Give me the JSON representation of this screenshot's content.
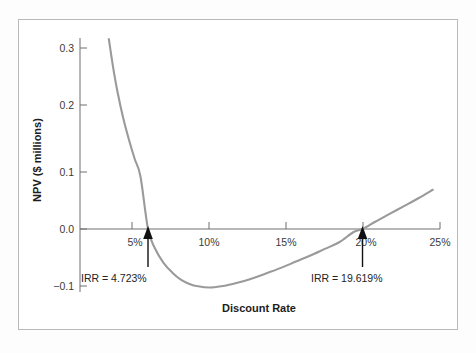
{
  "figure": {
    "curve_color": "#9a9a9a",
    "axis_color": "#6f6f6f",
    "frame_color": "#b9b9b9",
    "annotation_color": "#111111"
  },
  "chart_data": {
    "type": "line",
    "title": "",
    "subtitle": "",
    "xlabel": "Discount Rate",
    "ylabel": "NPV ($ millions)",
    "xlim": [
      0,
      26
    ],
    "ylim": [
      -0.13,
      0.33
    ],
    "grid": false,
    "legend": null,
    "x_unit": "%",
    "y_unit": "$ millions",
    "x_ticks": [
      5,
      10,
      15,
      20,
      25
    ],
    "x_tick_labels": [
      "5%",
      "10%",
      "15%",
      "20%",
      "25%"
    ],
    "y_ticks": [
      -0.1,
      0.0,
      0.1,
      0.2,
      0.3
    ],
    "y_tick_labels": [
      "−0.1",
      "0.0",
      "0.1",
      "0.2",
      "0.3"
    ],
    "zero_line": 0.0,
    "series": [
      {
        "name": "NPV",
        "x": [
          2.0,
          2.3,
          2.6,
          3.0,
          3.4,
          3.8,
          4.2,
          4.723,
          5.2,
          5.8,
          6.4,
          7.0,
          7.6,
          8.2,
          9.0,
          9.8,
          10.6,
          11.4,
          12.2,
          13.0,
          14.0,
          15.0,
          16.0,
          17.0,
          18.0,
          19.0,
          19.619,
          20.5,
          21.5,
          22.5,
          23.5,
          24.5
        ],
        "y": [
          0.315,
          0.268,
          0.228,
          0.184,
          0.148,
          0.116,
          0.087,
          0.0,
          -0.032,
          -0.056,
          -0.072,
          -0.084,
          -0.091,
          -0.095,
          -0.097,
          -0.095,
          -0.091,
          -0.086,
          -0.08,
          -0.073,
          -0.064,
          -0.054,
          -0.044,
          -0.033,
          -0.022,
          -0.005,
          0.0,
          0.012,
          0.025,
          0.038,
          0.051,
          0.065
        ]
      }
    ],
    "annotations": [
      {
        "id": "irr-low",
        "label": "IRR = 4.723%",
        "x": 4.723,
        "y": 0.0,
        "value": 4.723,
        "marker": "up-arrow"
      },
      {
        "id": "irr-high",
        "label": "IRR = 19.619%",
        "x": 19.619,
        "y": 0.0,
        "value": 19.619,
        "marker": "up-arrow"
      }
    ]
  }
}
